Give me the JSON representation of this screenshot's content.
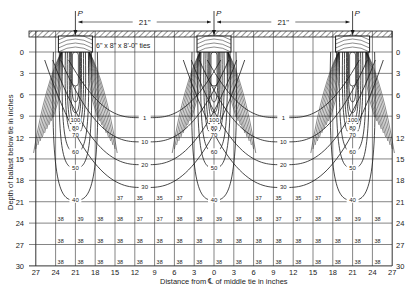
{
  "figure": {
    "load_label": "P",
    "spacing_label": "21\"",
    "tie_label": "6\" x 8\" x 8'-0\" ties",
    "x_axis_label": "Distance from ℄ of middle tie in inches",
    "y_axis_label": "Depth of ballast below tie in inches",
    "x_ticks": [
      "27",
      "24",
      "21",
      "18",
      "15",
      "12",
      "9",
      "6",
      "3",
      "0",
      "3",
      "6",
      "9",
      "12",
      "15",
      "18",
      "21",
      "24",
      "27"
    ],
    "y_ticks_left": [
      "0",
      "3",
      "6",
      "9",
      "12",
      "15",
      "18",
      "21",
      "24",
      "27",
      "30"
    ],
    "y_ticks_right": [
      "0",
      "3",
      "6",
      "9",
      "12",
      "15",
      "18",
      "21",
      "24",
      "27",
      "30"
    ],
    "tie_centers_in": [
      -21,
      0,
      21
    ],
    "tie_contour_labels": [
      "100",
      "80",
      "70",
      "60",
      "50",
      "40"
    ],
    "between_tie_contour_labels": [
      "1",
      "10",
      "20",
      "30"
    ],
    "row_21_values": [
      {
        "x": -15,
        "v": "37"
      },
      {
        "x": -12,
        "v": "35"
      },
      {
        "x": -9,
        "v": "35"
      },
      {
        "x": -6,
        "v": "37"
      },
      {
        "x": 6,
        "v": "37"
      },
      {
        "x": 9,
        "v": "35"
      },
      {
        "x": 12,
        "v": "35"
      },
      {
        "x": 15,
        "v": "37"
      }
    ],
    "row_24_values": [
      "38",
      "39",
      "38",
      "38",
      "37",
      "37",
      "38",
      "38",
      "39",
      "38",
      "38",
      "37",
      "37",
      "38",
      "38",
      "39",
      "38"
    ],
    "row_27_values": [
      "38",
      "38",
      "38",
      "38",
      "38",
      "38",
      "38",
      "38",
      "38",
      "38",
      "38",
      "38",
      "38",
      "38",
      "38",
      "38",
      "38"
    ],
    "row_30_values": [
      "38",
      "38",
      "38",
      "38",
      "38",
      "38",
      "38",
      "38",
      "38",
      "38",
      "38",
      "38",
      "38",
      "38",
      "38",
      "38",
      "38"
    ],
    "colors": {
      "ink": "#1a1a1a",
      "grid": "#333333",
      "background": "#ffffff"
    }
  }
}
